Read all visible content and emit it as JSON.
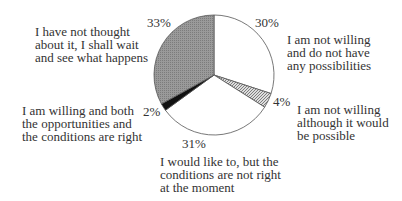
{
  "chart_data": {
    "type": "pie",
    "title": "",
    "start_angle": "12 o'clock, clockwise",
    "slices": [
      {
        "label": "I am not willing and do not have any possibilities",
        "value": 30,
        "pct_label": "30%",
        "fill": "white"
      },
      {
        "label": "I am not willing although it would be possible",
        "value": 4,
        "pct_label": "4%",
        "fill": "hatched"
      },
      {
        "label": "I would like to, but the conditions are not right at the moment",
        "value": 31,
        "pct_label": "31%",
        "fill": "white"
      },
      {
        "label": "I am willing and both the opportunities and the conditions are right",
        "value": 2,
        "pct_label": "2%",
        "fill": "black"
      },
      {
        "label": "I have not thought about it, I shall wait and see what happens",
        "value": 33,
        "pct_label": "33%",
        "fill": "gray"
      }
    ],
    "legend": "none (labels placed beside slices)"
  },
  "labels": {
    "s0": "I am not willing\nand do not have\nany possibilities",
    "s1": "I am not willing\nalthough it would\nbe possible",
    "s2": "I would like to, but the\nconditions are not right\nat the moment",
    "s3": "I am willing and both\nthe opportunities and\nthe conditions are right",
    "s4": "I have not thought\nabout it, I shall wait\nand see what happens"
  },
  "pcts": {
    "s0": "30%",
    "s1": "4%",
    "s2": "31%",
    "s3": "2%",
    "s4": "33%"
  }
}
